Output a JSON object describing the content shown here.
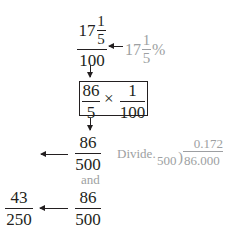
{
  "step1": {
    "numerator_whole": "17",
    "numerator_frac_num": "1",
    "numerator_frac_den": "5",
    "denominator": "100",
    "annotation_whole": "17",
    "annotation_frac_num": "1",
    "annotation_frac_den": "5",
    "annotation_symbol": "%"
  },
  "step2": {
    "left_num": "86",
    "left_den": "5",
    "operator": "×",
    "right_num": "1",
    "right_den": "100"
  },
  "step3": {
    "num": "86",
    "den": "500",
    "divide_label": "Divide.",
    "quotient": "0.172",
    "divisor": "500",
    "dividend": "86.000"
  },
  "connector": {
    "and_label": "and"
  },
  "step4": {
    "result_num": "43",
    "result_den": "250",
    "source_num": "86",
    "source_den": "500"
  },
  "colors": {
    "ink": "#231f20",
    "annotation_gray": "#9d9fa2"
  }
}
